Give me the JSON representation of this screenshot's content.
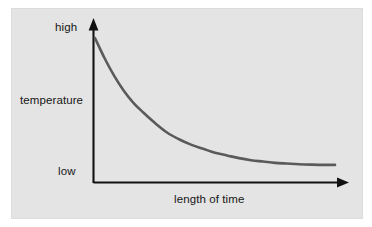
{
  "figure": {
    "panel_background": "#e4e4e4",
    "outer_background": "#ffffff",
    "axis_color": "#111111",
    "curve_color": "#5a5a5a"
  },
  "labels": {
    "y_axis_top": "high",
    "y_axis_bottom": "low",
    "y_axis_title": "temperature",
    "x_axis_title": "length of time"
  },
  "chart_data": {
    "type": "line",
    "title": "",
    "subtitle": "",
    "xlabel": "length of time",
    "ylabel": "temperature",
    "xlim": [
      0,
      100
    ],
    "ylim": [
      0,
      100
    ],
    "grid": false,
    "legend": "none",
    "x_tick_labels": [],
    "y_tick_labels": [
      "low",
      "high"
    ],
    "annotations": [
      "y-axis arrow points up",
      "x-axis arrow points right",
      "curve is a smooth exponential decay from high to low"
    ],
    "series": [
      {
        "name": "temperature",
        "x": [
          0,
          4,
          8,
          12,
          16,
          20,
          25,
          30,
          35,
          40,
          45,
          50,
          55,
          60,
          65,
          70,
          75,
          80,
          85,
          90,
          95,
          100
        ],
        "y": [
          100,
          85,
          72,
          61,
          52,
          45,
          37,
          30,
          25,
          21,
          18,
          15,
          13,
          11,
          9.5,
          8.5,
          7.5,
          7,
          6.5,
          6.2,
          6,
          6
        ]
      }
    ]
  }
}
